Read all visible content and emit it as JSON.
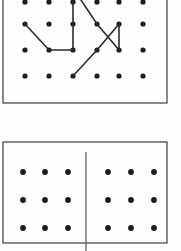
{
  "figure": {
    "canvas": {
      "width": 181,
      "height": 251
    },
    "colors": {
      "background": "#fefefe",
      "dot": "#1c1c1c",
      "frame": "#2b2b2b",
      "path": "#2b2b2b",
      "divider": "#3a3a3a"
    }
  },
  "panels": [
    {
      "id": "top-panel",
      "label": "Upper panel with polyline path on dot lattice",
      "frame": {
        "x": 3,
        "y": -10,
        "width": 164,
        "height": 113
      },
      "dot_radius": 2.6,
      "grid": {
        "columns_x": [
          25,
          49,
          73,
          97,
          119,
          143
        ],
        "rows_y": [
          2,
          24,
          50,
          76
        ],
        "column_count": 6,
        "row_count": 4,
        "note": "top row is clipped by the image edge"
      },
      "path_segments": [
        {
          "name": "seg-a",
          "points": "25,24 49,50 73,50 73,24 73,-12"
        },
        {
          "name": "seg-b",
          "points": "73,-12 97,24"
        },
        {
          "name": "seg-c",
          "points": "97,24 119,50"
        },
        {
          "name": "seg-d",
          "points": "97,50 119,24"
        },
        {
          "name": "seg-e",
          "points": "119,24 119,50"
        },
        {
          "name": "seg-f",
          "points": "73,76 97,50"
        }
      ]
    },
    {
      "id": "bottom-panel",
      "label": "Lower panel split into two three-by-three dot blocks",
      "frame": {
        "x": 3,
        "y": 142,
        "width": 164,
        "height": 101
      },
      "dot_radius": 2.9,
      "grid": {
        "columns_x": [
          23,
          45,
          68,
          108,
          131,
          154
        ],
        "rows_y": [
          172,
          200,
          228
        ],
        "column_count": 6,
        "row_count": 3
      },
      "divider": {
        "x": 86,
        "y1": 152,
        "y2": 251
      }
    }
  ]
}
